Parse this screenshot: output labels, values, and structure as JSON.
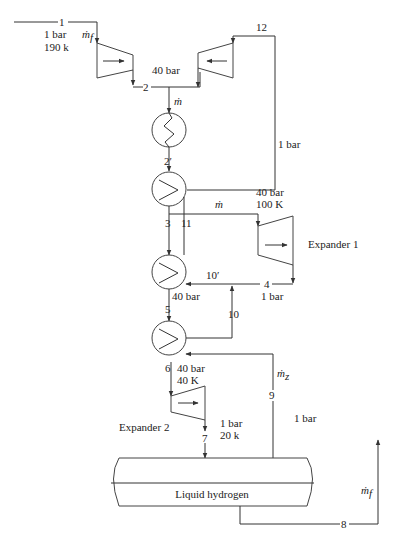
{
  "diagram": {
    "type": "process-flow",
    "colors": {
      "line": "#333333",
      "text": "#222222",
      "background": "#ffffff"
    },
    "state_points": {
      "p1": "1",
      "p2": "2",
      "p2prime": "2′",
      "p3": "3",
      "p4": "4",
      "p5": "5",
      "p6": "6",
      "p7": "7",
      "p8": "8",
      "p9": "9",
      "p10": "10",
      "p10prime": "10′",
      "p11": "11",
      "p12": "12"
    },
    "conditions": {
      "inlet_pressure": "1 bar",
      "inlet_temp": "190 k",
      "compressor_outlet_pressure": "40 bar",
      "return_line_pressure": "1 bar",
      "expander1_inlet_pressure": "40 bar",
      "expander1_inlet_temp": "100 K",
      "expander1_outlet_pressure": "1 bar",
      "hx3_outlet_pressure": "40 bar",
      "expander2_inlet_pressure": "40 bar",
      "expander2_inlet_temp": "40 K",
      "expander2_outlet_pressure": "1 bar",
      "expander2_outlet_temp": "20 k",
      "vapor_return_pressure": "1 bar"
    },
    "flow_labels": {
      "makeup_flow": "ṁ",
      "makeup_sub": "f",
      "main_flow": "ṁ",
      "expander_flow": "ṁ",
      "vapor_flow": "ṁ",
      "vapor_sub": "z",
      "product_flow": "ṁ",
      "product_sub": "f"
    },
    "components": {
      "expander1_label": "Expander 1",
      "expander2_label": "Expander 2",
      "tank_label": "Liquid hydrogen"
    }
  }
}
